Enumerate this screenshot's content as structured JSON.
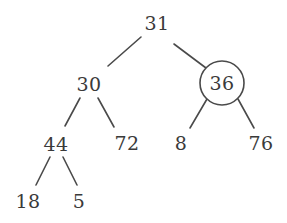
{
  "figure": {
    "type": "binary-tree-diagram",
    "background_color": "#ffffff",
    "ink_color": "#3a3a3a",
    "edge_color": "#4a4a4a"
  },
  "nodes": [
    {
      "id": "root",
      "label": "31",
      "x": 157,
      "y": 23,
      "circled": false
    },
    {
      "id": "n30",
      "label": "30",
      "x": 89,
      "y": 84,
      "circled": false
    },
    {
      "id": "n36",
      "label": "36",
      "x": 222,
      "y": 83,
      "circled": true
    },
    {
      "id": "n44",
      "label": "44",
      "x": 56,
      "y": 144,
      "circled": false
    },
    {
      "id": "n72",
      "label": "72",
      "x": 127,
      "y": 143,
      "circled": false
    },
    {
      "id": "n8",
      "label": "8",
      "x": 181,
      "y": 143,
      "circled": false
    },
    {
      "id": "n76",
      "label": "76",
      "x": 261,
      "y": 143,
      "circled": false
    },
    {
      "id": "n18",
      "label": "18",
      "x": 28,
      "y": 201,
      "circled": false
    },
    {
      "id": "n5",
      "label": "5",
      "x": 79,
      "y": 201,
      "circled": false
    }
  ],
  "highlight": {
    "node_id": "n36",
    "label": "36",
    "circle": {
      "cx": 222,
      "cy": 83,
      "r": 22
    }
  },
  "edges": [
    {
      "from": "root",
      "to": "n30",
      "x1": 141,
      "y1": 37,
      "x2": 108,
      "y2": 66
    },
    {
      "from": "root",
      "to": "n36",
      "x1": 174,
      "y1": 44,
      "x2": 206,
      "y2": 68
    },
    {
      "from": "n30",
      "to": "n44",
      "x1": 80,
      "y1": 98,
      "x2": 65,
      "y2": 126
    },
    {
      "from": "n30",
      "to": "n72",
      "x1": 98,
      "y1": 98,
      "x2": 114,
      "y2": 127
    },
    {
      "from": "n44",
      "to": "n18",
      "x1": 50,
      "y1": 157,
      "x2": 36,
      "y2": 185
    },
    {
      "from": "n44",
      "to": "n5",
      "x1": 63,
      "y1": 157,
      "x2": 77,
      "y2": 185
    },
    {
      "from": "n36",
      "to": "n8",
      "x1": 207,
      "y1": 99,
      "x2": 190,
      "y2": 128
    },
    {
      "from": "n36",
      "to": "n76",
      "x1": 238,
      "y1": 99,
      "x2": 254,
      "y2": 128
    }
  ]
}
